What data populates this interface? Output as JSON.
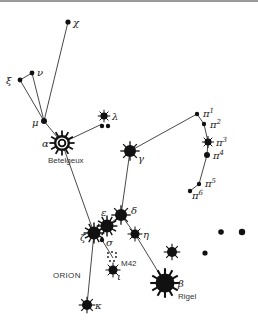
{
  "title": "ORION",
  "colors": {
    "ink": "#111111",
    "line": "#333333",
    "background": "#ffffff"
  },
  "labels": {
    "constellation": "ORION",
    "betelgeuse": "Betelgeux",
    "rigel": "Rigel",
    "nebula": "M42"
  },
  "stars": [
    {
      "id": "chi",
      "greek": "χ",
      "x": 68,
      "y": 22,
      "r": 2.6,
      "rays": false,
      "lx": 73,
      "ly": 26
    },
    {
      "id": "xi",
      "greek": "ξ",
      "x": 20,
      "y": 80,
      "r": 2.4,
      "rays": false,
      "lx": 6,
      "ly": 84
    },
    {
      "id": "nu",
      "greek": "ν",
      "x": 32,
      "y": 73,
      "r": 2.4,
      "rays": false,
      "lx": 37,
      "ly": 76
    },
    {
      "id": "mu",
      "greek": "μ",
      "x": 44,
      "y": 121,
      "r": 3.0,
      "rays": false,
      "lx": 32,
      "ly": 126
    },
    {
      "id": "lambda",
      "greek": "λ",
      "x": 104,
      "y": 116,
      "r": 3.6,
      "rays": true,
      "lx": 112,
      "ly": 120
    },
    {
      "id": "lambda-b",
      "greek": "",
      "x": 102,
      "y": 126,
      "r": 2.2,
      "rays": false
    },
    {
      "id": "lambda-c",
      "greek": "",
      "x": 108,
      "y": 126,
      "r": 2.2,
      "rays": false
    },
    {
      "id": "gamma",
      "greek": "γ",
      "x": 130,
      "y": 151,
      "r": 6,
      "rays": true,
      "lx": 138,
      "ly": 162
    },
    {
      "id": "pi1",
      "greek": "π",
      "sup": "1",
      "x": 197,
      "y": 114,
      "r": 2.2,
      "rays": false,
      "lx": 203,
      "ly": 117
    },
    {
      "id": "pi2",
      "greek": "π",
      "sup": "2",
      "x": 204,
      "y": 124,
      "r": 2.2,
      "rays": false,
      "lx": 210,
      "ly": 128
    },
    {
      "id": "pi3",
      "greek": "π",
      "sup": "3",
      "x": 208,
      "y": 142,
      "r": 3.5,
      "rays": true,
      "lx": 216,
      "ly": 146
    },
    {
      "id": "pi4",
      "greek": "π",
      "sup": "4",
      "x": 207,
      "y": 155,
      "r": 3,
      "rays": false,
      "lx": 213,
      "ly": 159
    },
    {
      "id": "pi5",
      "greek": "π",
      "sup": "5",
      "x": 199,
      "y": 184,
      "r": 2.2,
      "rays": false,
      "lx": 205,
      "ly": 187
    },
    {
      "id": "pi6",
      "greek": "π",
      "sup": "6",
      "x": 190,
      "y": 191,
      "r": 2.2,
      "rays": false,
      "lx": 192,
      "ly": 199
    },
    {
      "id": "delta",
      "greek": "δ",
      "x": 121,
      "y": 215,
      "r": 6,
      "rays": true,
      "lx": 131,
      "ly": 214
    },
    {
      "id": "epsilon",
      "greek": "ε",
      "x": 107,
      "y": 226,
      "r": 6.5,
      "rays": true,
      "lx": 101,
      "ly": 216
    },
    {
      "id": "zeta",
      "greek": "ζ",
      "x": 94,
      "y": 233,
      "r": 6.5,
      "rays": true,
      "lx": 80,
      "ly": 241
    },
    {
      "id": "sigma",
      "greek": "σ",
      "x": 102,
      "y": 240,
      "r": 2.2,
      "rays": false,
      "lx": 106,
      "ly": 246
    },
    {
      "id": "eta",
      "greek": "η",
      "x": 135,
      "y": 234,
      "r": 4.5,
      "rays": true,
      "lx": 143,
      "ly": 238
    },
    {
      "id": "iota",
      "greek": "ι",
      "x": 113,
      "y": 270,
      "r": 4.5,
      "rays": true,
      "lx": 117,
      "ly": 280
    },
    {
      "id": "kappa",
      "greek": "κ",
      "x": 87,
      "y": 305,
      "r": 5,
      "rays": true,
      "lx": 95,
      "ly": 309
    },
    {
      "id": "beta",
      "greek": "β",
      "x": 165,
      "y": 283,
      "r": 9.5,
      "rays": true,
      "lx": 178,
      "ly": 287
    },
    {
      "id": "star-e1",
      "greek": "",
      "x": 172,
      "y": 252,
      "r": 5,
      "rays": true
    },
    {
      "id": "star-e2",
      "greek": "",
      "x": 205,
      "y": 253,
      "r": 2.6,
      "rays": false
    },
    {
      "id": "star-e3",
      "greek": "",
      "x": 221,
      "y": 232,
      "r": 2.8,
      "rays": false
    },
    {
      "id": "star-e4",
      "greek": "",
      "x": 242,
      "y": 232,
      "r": 3.2,
      "rays": false
    }
  ],
  "betelgeuse": {
    "greek": "α",
    "x": 62,
    "y": 143,
    "r": 8,
    "lx": 42,
    "ly": 147
  },
  "lines": [
    [
      68,
      22,
      44,
      121
    ],
    [
      20,
      80,
      44,
      121
    ],
    [
      32,
      73,
      44,
      121
    ],
    [
      20,
      80,
      32,
      73
    ],
    [
      44,
      121,
      62,
      143
    ],
    [
      62,
      143,
      102,
      124
    ],
    [
      62,
      143,
      94,
      233
    ],
    [
      130,
      151,
      121,
      215
    ],
    [
      130,
      151,
      197,
      114
    ],
    [
      197,
      114,
      204,
      124
    ],
    [
      204,
      124,
      208,
      142
    ],
    [
      208,
      142,
      207,
      155
    ],
    [
      207,
      155,
      199,
      184
    ],
    [
      199,
      184,
      190,
      191
    ],
    [
      94,
      233,
      107,
      226
    ],
    [
      107,
      226,
      121,
      215
    ],
    [
      121,
      215,
      135,
      234
    ],
    [
      135,
      234,
      165,
      283
    ],
    [
      94,
      233,
      87,
      305
    ],
    [
      102,
      240,
      113,
      258
    ]
  ],
  "m42_dots": [
    [
      108,
      253
    ],
    [
      112,
      252
    ],
    [
      116,
      253
    ],
    [
      108,
      257
    ],
    [
      116,
      257
    ],
    [
      110,
      261
    ],
    [
      114,
      261
    ]
  ],
  "label_positions": {
    "betelgeuse": [
      48,
      163
    ],
    "rigel": [
      178,
      299
    ],
    "nebula": [
      121,
      266
    ],
    "constellation": [
      53,
      278
    ]
  }
}
